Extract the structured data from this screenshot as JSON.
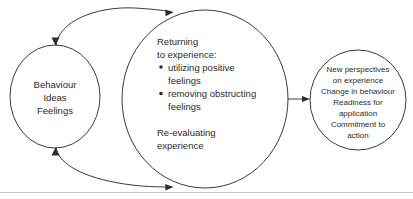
{
  "diagram": {
    "colors": {
      "stroke": "#3a3a3a",
      "text": "#2b2b2b",
      "background": "#ffffff",
      "arrow": "#2e2e2e"
    },
    "nodes": {
      "left": {
        "name": "behaviour-ideas-feelings",
        "lines": [
          "Behaviour",
          "Ideas",
          "Feelings"
        ]
      },
      "center": {
        "name": "returning-to-experience",
        "heading": [
          "Returning",
          "to experience:"
        ],
        "bullets": [
          [
            "utilizing positive",
            "feelings"
          ],
          [
            "removing obstructing",
            "feelings"
          ]
        ],
        "footer": [
          "Re-evaluating",
          "experience"
        ]
      },
      "right": {
        "name": "outcomes",
        "lines": [
          "New perspectives",
          "on experience",
          "Change in behaviour",
          "Readiness for",
          "application",
          "Commitment to",
          "action"
        ]
      }
    },
    "connectors": [
      {
        "name": "top-bidirectional-arrow",
        "from": "left",
        "to": "center",
        "direction": "bidirectional"
      },
      {
        "name": "bottom-bidirectional-arrow",
        "from": "left",
        "to": "center",
        "direction": "bidirectional"
      },
      {
        "name": "center-to-right-arrow",
        "from": "center",
        "to": "right",
        "direction": "forward"
      }
    ]
  }
}
